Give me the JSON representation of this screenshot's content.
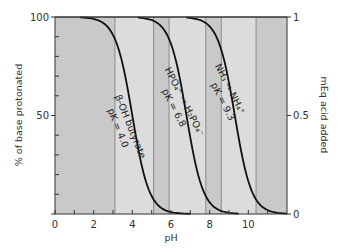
{
  "chart_data": {
    "type": "line",
    "title": "",
    "xlabel": "pH",
    "ylabel": "% of base protonated",
    "ylabel_right": "mEq acid added",
    "xlim": [
      0,
      12
    ],
    "ylim": [
      0,
      100
    ],
    "ylim_right": [
      0,
      1
    ],
    "x_ticks": [
      0,
      2,
      4,
      6,
      8,
      10
    ],
    "x_minor_ticks": [
      1,
      3,
      5,
      7,
      9,
      11
    ],
    "y_ticks": [
      0,
      50,
      100
    ],
    "y_tick_labels": [
      "",
      "50",
      "100"
    ],
    "y_minor_ticks": [
      10,
      20,
      30,
      40,
      60,
      70,
      80,
      90
    ],
    "y_right_ticks": [
      0,
      0.5,
      1
    ],
    "y_right_tick_labels": [
      "0",
      "0.5",
      "1"
    ],
    "grid": false,
    "legend": "none",
    "bands": [
      {
        "from": 0,
        "to": 3.1,
        "shade": "dark"
      },
      {
        "from": 3.1,
        "to": 5.1,
        "shade": "light"
      },
      {
        "from": 5.1,
        "to": 5.9,
        "shade": "dark"
      },
      {
        "from": 5.9,
        "to": 7.8,
        "shade": "light"
      },
      {
        "from": 7.8,
        "to": 8.6,
        "shade": "dark"
      },
      {
        "from": 8.6,
        "to": 10.4,
        "shade": "light"
      },
      {
        "from": 10.4,
        "to": 12,
        "shade": "dark"
      }
    ],
    "series": [
      {
        "name": "β-OH butyrate",
        "pK": 4.0,
        "label_line1": "β-OH butyrate",
        "label_line2": "pK = 4.0",
        "x": [
          1.3,
          2.0,
          2.5,
          3.0,
          3.5,
          4.0,
          4.5,
          5.0,
          5.5,
          6.0,
          6.5,
          7.0
        ],
        "values": [
          99.8,
          99.0,
          96.9,
          90.9,
          76.0,
          50.0,
          24.0,
          9.1,
          3.1,
          1.0,
          0.3,
          0.1
        ]
      },
      {
        "name": "HPO4= → H2PO4-",
        "pK": 6.8,
        "label_line1": "HPO₄⁼ → H₂PO₄⁻",
        "label_line2": "pK = 6.8",
        "x": [
          4.3,
          5.0,
          5.5,
          6.0,
          6.5,
          6.8,
          7.0,
          7.5,
          8.0,
          8.5,
          9.0,
          9.5
        ],
        "values": [
          99.7,
          98.4,
          95.2,
          86.3,
          66.6,
          50.0,
          38.7,
          16.6,
          5.9,
          2.0,
          0.6,
          0.2
        ]
      },
      {
        "name": "NH3 → NH4+",
        "pK": 9.3,
        "label_line1": "NH₃ → NH₄⁺",
        "label_line2": "pK = 9.3",
        "x": [
          6.8,
          7.5,
          8.0,
          8.5,
          9.0,
          9.3,
          9.5,
          10.0,
          10.5,
          11.0,
          11.5,
          12.0
        ],
        "values": [
          99.7,
          98.4,
          95.2,
          86.3,
          66.6,
          50.0,
          38.7,
          16.6,
          5.9,
          2.0,
          0.6,
          0.2
        ]
      }
    ]
  },
  "colors": {
    "band_dark": "#c9c9c9",
    "band_light": "#dcdcdc",
    "band_line": "#8a8a8a",
    "curve": "#111111",
    "axis": "#333333"
  }
}
